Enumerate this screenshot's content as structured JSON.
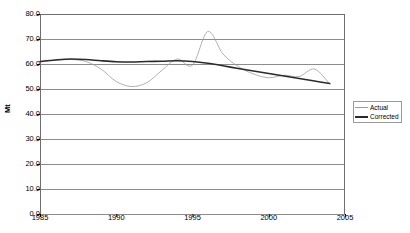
{
  "chart_data": {
    "type": "line",
    "title": "",
    "xlabel": "",
    "ylabel": "Mt",
    "xlim": [
      1985,
      2005
    ],
    "ylim": [
      0,
      80
    ],
    "ytick_step": 10,
    "xtick_step": 5,
    "grid": true,
    "grid_axis": "y",
    "legend_position": "right-middle",
    "xticks": [
      "1985",
      "1990",
      "1995",
      "2000",
      "2005"
    ],
    "yticks": [
      "0.0",
      "10.0",
      "20.0",
      "30.0",
      "40.0",
      "50.0",
      "60.0",
      "70.0",
      "80.0"
    ],
    "x": [
      1985,
      1986,
      1987,
      1988,
      1989,
      1990,
      1991,
      1992,
      1993,
      1994,
      1995,
      1996,
      1997,
      1998,
      1999,
      2000,
      2001,
      2002,
      2003,
      2004
    ],
    "series": [
      {
        "name": "Actual",
        "color": "#9d9d9d",
        "width": 0.8,
        "values": [
          61.0,
          61.5,
          61.8,
          61.0,
          58.0,
          53.0,
          51.0,
          52.5,
          57.5,
          62.0,
          59.5,
          73.0,
          64.0,
          59.0,
          56.0,
          54.5,
          55.5,
          55.0,
          58.0,
          52.0
        ]
      },
      {
        "name": "Corrected",
        "color": "#2b2b2b",
        "width": 1.6,
        "values": [
          61.0,
          61.6,
          62.0,
          61.8,
          61.3,
          60.9,
          60.8,
          61.0,
          61.1,
          61.3,
          61.0,
          60.3,
          59.3,
          58.2,
          57.2,
          56.2,
          55.2,
          54.2,
          53.2,
          52.2
        ]
      }
    ]
  },
  "legend": {
    "items": [
      {
        "label": "Actual"
      },
      {
        "label": "Corrected"
      }
    ]
  },
  "colors": {
    "actual": "#9d9d9d",
    "corrected": "#2b2b2b",
    "grid": "#8c8c8c",
    "border": "#6e6e6e",
    "background": "#ffffff"
  }
}
